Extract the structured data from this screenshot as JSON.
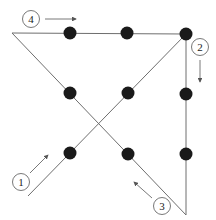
{
  "diagram": {
    "colors": {
      "dot": "#1a1a1a",
      "line": "#6e6e6e",
      "arrow": "#555555",
      "circle": "#555555"
    },
    "dots": [
      {
        "x": 70,
        "y": 33
      },
      {
        "x": 127,
        "y": 33
      },
      {
        "x": 186,
        "y": 34
      },
      {
        "x": 70,
        "y": 93
      },
      {
        "x": 128,
        "y": 93
      },
      {
        "x": 186,
        "y": 94
      },
      {
        "x": 70,
        "y": 153
      },
      {
        "x": 128,
        "y": 154
      },
      {
        "x": 186,
        "y": 154
      }
    ],
    "lines": [
      {
        "step": "1",
        "x1": 28,
        "y1": 196,
        "x2": 186,
        "y2": 34
      },
      {
        "step": "2",
        "x1": 186,
        "y1": 34,
        "x2": 186,
        "y2": 215
      },
      {
        "step": "3",
        "x1": 186,
        "y1": 215,
        "x2": 12,
        "y2": 33
      },
      {
        "step": "4",
        "x1": 12,
        "y1": 33,
        "x2": 186,
        "y2": 34
      }
    ],
    "step_labels": [
      {
        "label": "1",
        "cx": 21,
        "cy": 182,
        "arrow": {
          "x1": 30,
          "y1": 173,
          "x2": 48,
          "y2": 155
        }
      },
      {
        "label": "2",
        "cx": 200,
        "cy": 47,
        "arrow": {
          "x1": 200,
          "y1": 60,
          "x2": 200,
          "y2": 82
        }
      },
      {
        "label": "3",
        "cx": 162,
        "cy": 206,
        "arrow": {
          "x1": 152,
          "y1": 198,
          "x2": 134,
          "y2": 182
        }
      },
      {
        "label": "4",
        "cx": 31,
        "cy": 19,
        "arrow": {
          "x1": 45,
          "y1": 19,
          "x2": 76,
          "y2": 19
        }
      }
    ]
  }
}
